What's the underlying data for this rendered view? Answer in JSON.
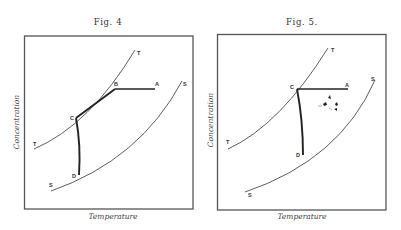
{
  "figures": [
    {
      "title": "Fig. 4",
      "xlabel": "Temperature",
      "ylabel": "Concentration",
      "curve_labels": {
        "t_lower": "T",
        "t_upper": "T",
        "s_lower": "S",
        "s_upper": "S"
      },
      "points": {
        "a": "A",
        "b": "B",
        "c": "C",
        "d": "D"
      }
    },
    {
      "title": "Fig. 5.",
      "xlabel": "Temperature",
      "ylabel": "Concentration",
      "curve_labels": {
        "t_lower": "T",
        "t_upper": "T",
        "s_lower": "S",
        "s_upper": "S"
      },
      "points": {
        "a": "A",
        "c": "C",
        "d": "D"
      }
    }
  ]
}
